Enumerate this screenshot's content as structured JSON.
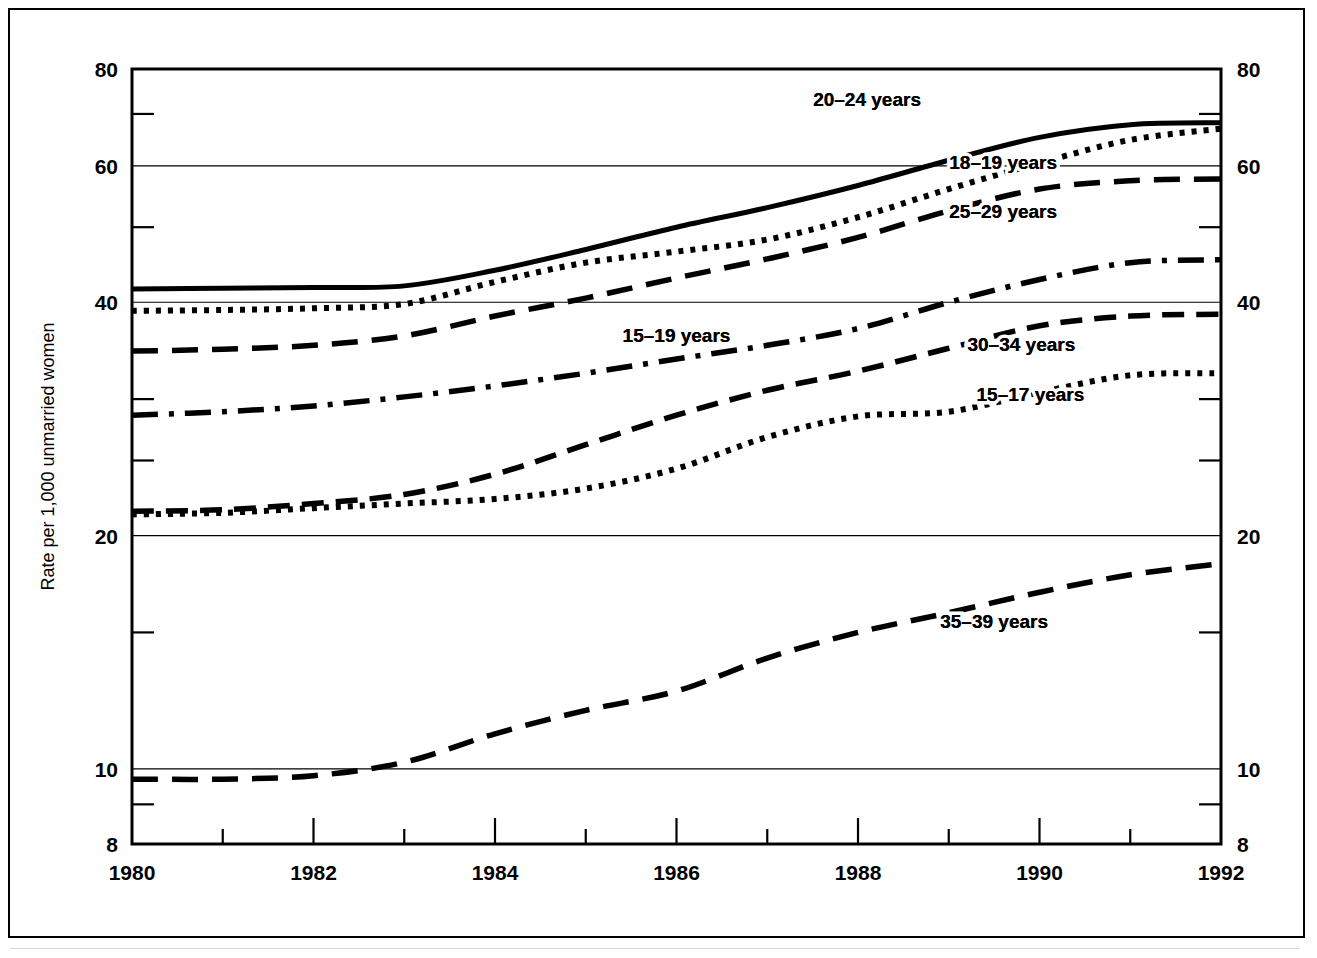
{
  "figure": {
    "ylabel": "Rate per 1,000 unmarried women",
    "y_ticks_major": [
      "80",
      "60",
      "40",
      "20",
      "10",
      "8"
    ],
    "x_ticks_major": [
      "1980",
      "1982",
      "1984",
      "1986",
      "1988",
      "1990",
      "1992"
    ]
  },
  "chart_data": {
    "type": "line",
    "title": "",
    "subtitle": "",
    "xlabel": "",
    "ylabel": "Rate per 1,000 unmarried women",
    "scale": "log",
    "xlim": [
      1980,
      1992
    ],
    "ylim": [
      8,
      80
    ],
    "grid": true,
    "legend_position": "inline-annotations",
    "y_tick_values": [
      80,
      60,
      40,
      20,
      10,
      8
    ],
    "y_minor_tick_values": [
      70,
      50,
      30,
      25,
      15,
      9
    ],
    "x": [
      1980,
      1981,
      1982,
      1983,
      1984,
      1985,
      1986,
      1987,
      1988,
      1989,
      1990,
      1991,
      1992
    ],
    "x_tick_values": [
      1980,
      1982,
      1984,
      1986,
      1988,
      1990,
      1992
    ],
    "series": [
      {
        "name": "20-24 years",
        "label": "20–24 years",
        "style": "solid",
        "values": [
          41.6,
          41.7,
          41.8,
          42.0,
          44.0,
          46.8,
          50.0,
          53.0,
          56.6,
          61.0,
          65.3,
          67.8,
          68.2
        ]
      },
      {
        "name": "18-19 years",
        "label": "18–19 years",
        "style": "dotted",
        "values": [
          39.0,
          39.1,
          39.3,
          39.8,
          42.5,
          45.0,
          46.5,
          48.2,
          51.5,
          56.0,
          60.5,
          64.8,
          67.0
        ]
      },
      {
        "name": "25-29 years",
        "label": "25–29 years",
        "style": "dashed-long",
        "values": [
          34.6,
          34.8,
          35.2,
          36.2,
          38.4,
          40.5,
          43.0,
          45.5,
          48.5,
          52.5,
          56.0,
          57.4,
          57.7
        ]
      },
      {
        "name": "15-19 years",
        "label": "15–19 years",
        "style": "dash-dot",
        "values": [
          28.6,
          28.9,
          29.4,
          30.2,
          31.2,
          32.4,
          33.8,
          35.2,
          37.0,
          40.0,
          42.8,
          45.0,
          45.4
        ]
      },
      {
        "name": "30-34 years",
        "label": "30–34 years",
        "style": "dashed-medium",
        "values": [
          21.5,
          21.6,
          22.0,
          22.6,
          24.0,
          26.2,
          28.6,
          30.8,
          32.6,
          34.9,
          37.3,
          38.4,
          38.6
        ]
      },
      {
        "name": "15-17 years",
        "label": "15–17 years",
        "style": "dotted",
        "values": [
          21.3,
          21.4,
          21.7,
          22.0,
          22.3,
          23.0,
          24.4,
          26.8,
          28.5,
          28.9,
          30.6,
          32.2,
          32.4
        ]
      },
      {
        "name": "35-39 years",
        "label": "35–39 years",
        "style": "dashed-long",
        "values": [
          9.7,
          9.7,
          9.8,
          10.2,
          11.1,
          11.9,
          12.6,
          13.9,
          15.0,
          15.9,
          16.9,
          17.8,
          18.4
        ]
      }
    ],
    "annotations": [
      {
        "text": "20–24 years",
        "x": 1988.1,
        "y": 71.6
      },
      {
        "text": "18–19 years",
        "x": 1989.6,
        "y": 59.4
      },
      {
        "text": "25–29 years",
        "x": 1989.6,
        "y": 51.4
      },
      {
        "text": "15–19 years",
        "x": 1986.0,
        "y": 35.6
      },
      {
        "text": "30–34 years",
        "x": 1989.8,
        "y": 34.6
      },
      {
        "text": "15–17 years",
        "x": 1989.9,
        "y": 29.8
      },
      {
        "text": "35–39 years",
        "x": 1989.5,
        "y": 15.2
      }
    ]
  }
}
